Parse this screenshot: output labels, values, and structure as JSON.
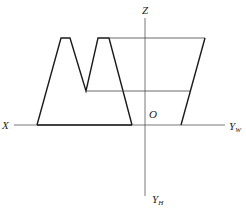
{
  "diagram": {
    "type": "orthographic-projection",
    "axes": {
      "x_label": "X",
      "z_label": "Z",
      "origin_label": "O",
      "yw_label": "Y",
      "yw_sub": "W",
      "yh_label": "Y",
      "yh_sub": "H"
    },
    "colors": {
      "outline": "#1a1a1a",
      "axis": "#555555",
      "projection_line": "#444444"
    },
    "front_view": {
      "description": "M-shaped profile with two trapezoidal peaks",
      "points": [
        [
          37,
          125
        ],
        [
          61,
          38
        ],
        [
          70,
          38
        ],
        [
          86,
          91
        ],
        [
          98,
          38
        ],
        [
          109,
          38
        ],
        [
          132,
          125
        ]
      ]
    },
    "side_view": {
      "description": "Trapezoid with slanted right edge",
      "top_y": 38,
      "mid_y": 91,
      "bottom_y": 125,
      "top_right_x": 205,
      "bottom_right_x": 181
    }
  }
}
